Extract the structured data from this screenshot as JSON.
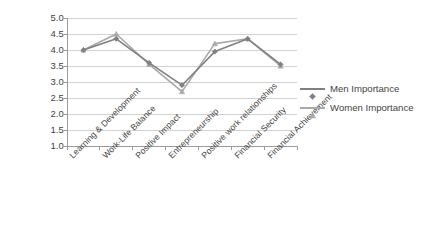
{
  "chart_data": {
    "type": "line",
    "title": "",
    "subtitle": "",
    "xlabel": "",
    "ylabel": "",
    "ylim": [
      1.0,
      5.0
    ],
    "ytick_step": 0.5,
    "yticks": [
      "5.0",
      "4.5",
      "4.0",
      "3.5",
      "3.0",
      "2.5",
      "2.0",
      "1.5",
      "1.0"
    ],
    "ytick_values": [
      5.0,
      4.5,
      4.0,
      3.5,
      3.0,
      2.5,
      2.0,
      1.5,
      1.0
    ],
    "grid": "horizontal",
    "legend_position": "right",
    "categories": [
      "Learning & Development",
      "Work-Life Balance",
      "Positive Impact",
      "Entrepreneurship",
      "Positive work relationships",
      "Financial Security",
      "Financial Achievement"
    ],
    "series": [
      {
        "name": "Men Importance",
        "color": "#808080",
        "marker": "diamond",
        "values": [
          4.0,
          4.35,
          3.6,
          2.9,
          3.95,
          4.35,
          3.55
        ]
      },
      {
        "name": "Women Importance",
        "color": "#a9a9a9",
        "marker": "triangle",
        "values": [
          4.0,
          4.5,
          3.55,
          2.7,
          4.2,
          4.35,
          3.5
        ]
      }
    ]
  },
  "legend": {
    "items": [
      {
        "label": "Men Importance"
      },
      {
        "label": "Women Importance"
      }
    ]
  },
  "colors": {
    "men": "#808080",
    "women": "#a9a9a9",
    "grid": "#c8c8c8",
    "axis": "#9b9b9b",
    "text": "#3f3f3f",
    "background": "#ffffff"
  }
}
